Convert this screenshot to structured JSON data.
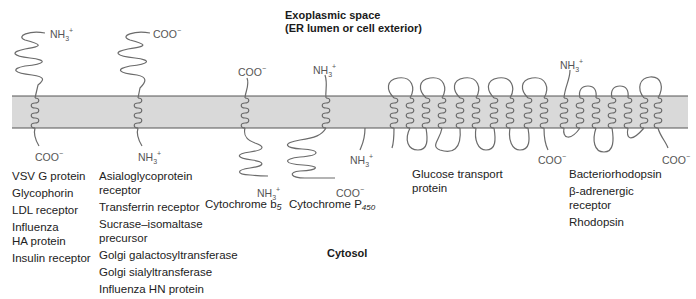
{
  "regions": {
    "exoplasmic_line1": "Exoplasmic space",
    "exoplasmic_line2": "(ER lumen or cell exterior)",
    "cytosol": "Cytosol"
  },
  "colors": {
    "membrane_fill": "#d9d9d9",
    "membrane_edge": "#555555",
    "protein_line": "#6b6b6b"
  },
  "termini": {
    "nh3": "NH3+",
    "coo": "COO−"
  },
  "groups": [
    {
      "id": "type1",
      "n_term": "NH3+",
      "c_term": "COO−",
      "proteins": [
        "VSV G protein",
        "Glycophorin",
        "LDL receptor",
        "Influenza HA protein",
        "Insulin receptor"
      ]
    },
    {
      "id": "type2",
      "n_term": "NH3+",
      "c_term": "COO−",
      "proteins": [
        "Asialoglycoprotein receptor",
        "Transferrin receptor",
        "Sucrase–isomaltase precursor",
        "Golgi galactosyltransferase",
        "Golgi sialyltransferase",
        "Influenza HN protein"
      ]
    },
    {
      "id": "cyt-b5",
      "label": "Cytochrome b",
      "label_sub": "5"
    },
    {
      "id": "cyt-p450",
      "label": "Cytochrome P",
      "label_sub": "450"
    },
    {
      "id": "glut",
      "proteins": [
        "Glucose transport protein"
      ]
    },
    {
      "id": "7tm",
      "proteins": [
        "Bacteriorhodopsin",
        "β-adrenergic receptor",
        "Rhodopsin"
      ]
    }
  ],
  "labels": {
    "g1": [
      "VSV G protein",
      "Glycophorin",
      "LDL receptor",
      "Influenza",
      "HA protein",
      "Insulin receptor"
    ],
    "g2_a1": "Asialoglycoprotein",
    "g2_a2": "receptor",
    "g2_b": "Transferrin receptor",
    "g2_c1": "Sucrase–isomaltase",
    "g2_c2": "precursor",
    "g2_d": "Golgi galactosyltransferase",
    "g2_e": "Golgi sialyltransferase",
    "g2_f": "Influenza HN protein",
    "b5": "Cytochrome b",
    "b5_sub": "5",
    "p450": "Cytochrome P",
    "p450_sub": "450",
    "glut1": "Glucose transport",
    "glut2": "protein",
    "tm7_a": "Bacteriorhodopsin",
    "tm7_b1": "β-adrenergic",
    "tm7_b2": "receptor",
    "tm7_c": "Rhodopsin"
  },
  "term_labels": {
    "nh3_base": "NH",
    "nh3_sub": "3",
    "nh3_sup": "+",
    "coo_base": "COO",
    "coo_sup": "−"
  }
}
